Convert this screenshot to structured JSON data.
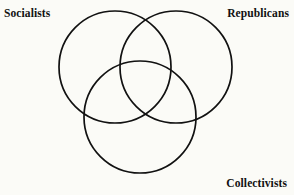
{
  "diagram": {
    "type": "venn-3-circle",
    "background_color": "#fbfbf7",
    "stroke_color": "#111111",
    "stroke_width": 1.7,
    "fill": "none",
    "sets": [
      {
        "id": "socialists",
        "label": "Socialists",
        "circle": {
          "cx": 115,
          "cy": 67,
          "r": 56
        },
        "label_position": "top-left"
      },
      {
        "id": "republicans",
        "label": "Republicans",
        "circle": {
          "cx": 176,
          "cy": 67,
          "r": 56
        },
        "label_position": "top-right"
      },
      {
        "id": "collectivists",
        "label": "Collectivists",
        "circle": {
          "cx": 140,
          "cy": 117,
          "r": 56
        },
        "label_position": "bottom-right"
      }
    ]
  }
}
